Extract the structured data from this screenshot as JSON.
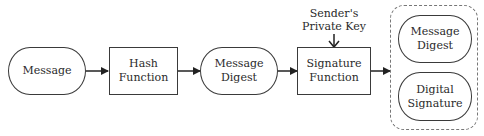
{
  "diagram": {
    "nodes": [
      {
        "id": "message",
        "shape": "stadium",
        "label": "Message"
      },
      {
        "id": "hash_function",
        "shape": "rectangle",
        "label": "Hash\nFunction"
      },
      {
        "id": "message_digest",
        "shape": "stadium",
        "label": "Message\nDigest"
      },
      {
        "id": "signature_function",
        "shape": "rectangle",
        "label": "Signature\nFunction"
      },
      {
        "id": "output_message_digest",
        "shape": "stadium",
        "label": "Message\nDigest"
      },
      {
        "id": "output_digital_signature",
        "shape": "stadium",
        "label": "Digital\nSignature"
      }
    ],
    "input_label": "Sender's\nPrivate Key",
    "group": {
      "id": "output_group",
      "style": "dashed",
      "members": [
        "output_message_digest",
        "output_digital_signature"
      ]
    },
    "edges": [
      {
        "from": "message",
        "to": "hash_function"
      },
      {
        "from": "hash_function",
        "to": "message_digest"
      },
      {
        "from": "message_digest",
        "to": "signature_function"
      },
      {
        "from": "senders_private_key",
        "to": "signature_function"
      },
      {
        "from": "signature_function",
        "to": "output_group"
      }
    ],
    "colors": {
      "stroke": "#3a3a3a",
      "dashed_group": "#777777",
      "background": "#ffffff"
    }
  }
}
